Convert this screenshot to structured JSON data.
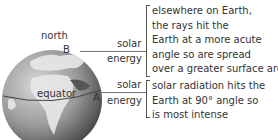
{
  "globe": {
    "north_label": "north",
    "equator_label": "equator",
    "point_a": "A",
    "point_b": "B"
  },
  "rays": [
    {
      "line1": "solar",
      "line2": "energy"
    },
    {
      "line1": "solar",
      "line2": "energy"
    }
  ],
  "annotations": [
    {
      "lines": [
        "elsewhere on Earth,",
        "the rays hit the",
        "Earth at a more acute",
        "angle so are spread",
        "over a greater surface area."
      ]
    },
    {
      "lines": [
        "solar radiation hits the",
        "Earth at 90° angle so",
        "is most intense"
      ]
    }
  ]
}
